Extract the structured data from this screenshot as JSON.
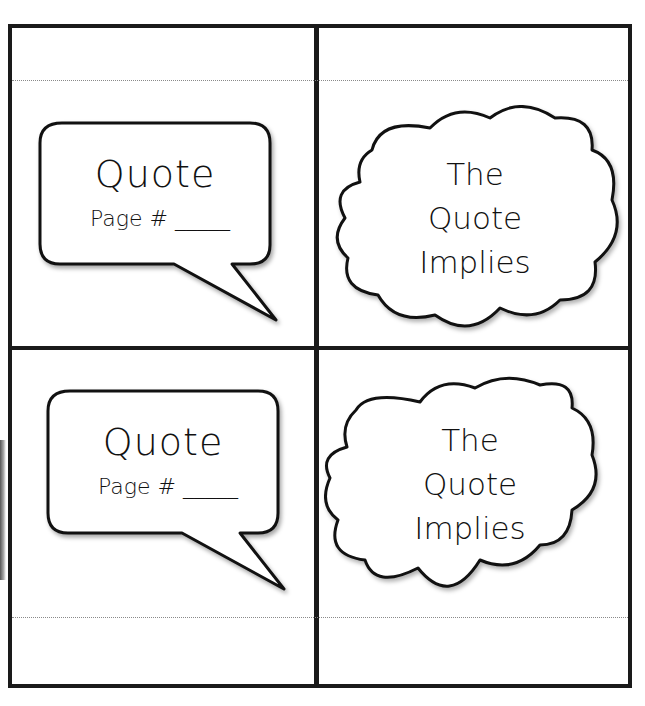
{
  "worksheet": {
    "cells": [
      {
        "type": "speech-bubble",
        "title": "Quote",
        "page_label": "Page #",
        "blank": "_____"
      },
      {
        "type": "thought-cloud",
        "lines": [
          "The",
          "Quote",
          "Implies"
        ]
      },
      {
        "type": "speech-bubble",
        "title": "Quote",
        "page_label": "Page #",
        "blank": "_____"
      },
      {
        "type": "thought-cloud",
        "lines": [
          "The",
          "Quote",
          "Implies"
        ]
      }
    ],
    "colors": {
      "border": "#1a1a1a",
      "dotted_line": "#8a8a8a",
      "background": "#ffffff"
    }
  }
}
